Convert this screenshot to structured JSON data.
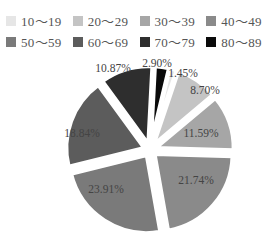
{
  "chart_data": {
    "type": "pie",
    "title": "",
    "legend_position": "top",
    "categories": [
      "10～19",
      "20～29",
      "30～39",
      "40～49",
      "50～59",
      "60～69",
      "70～79",
      "80～89"
    ],
    "values": [
      1.45,
      8.7,
      11.59,
      21.74,
      23.91,
      18.84,
      10.87,
      2.9
    ],
    "labels": [
      "1.45%",
      "8.70%",
      "11.59%",
      "21.74%",
      "23.91%",
      "18.84%",
      "10.87%",
      "2.90%"
    ],
    "colors": [
      "#e6e6e6",
      "#c4c4c4",
      "#a6a6a6",
      "#8a8a8a",
      "#7a7a7a",
      "#5c5c5c",
      "#2e2e2e",
      "#0a0a0a"
    ],
    "exploded": true,
    "slice_order_clockwise_from_top": [
      "80～89",
      "10～19",
      "20～29",
      "30～39",
      "40～49",
      "50～59",
      "60～69",
      "70～79"
    ]
  },
  "legend": {
    "items": [
      {
        "label": "10～19",
        "color": "#e6e6e6"
      },
      {
        "label": "20～29",
        "color": "#c4c4c4"
      },
      {
        "label": "30～39",
        "color": "#a6a6a6"
      },
      {
        "label": "40～49",
        "color": "#8a8a8a"
      },
      {
        "label": "50～59",
        "color": "#7a7a7a"
      },
      {
        "label": "60～69",
        "color": "#5c5c5c"
      },
      {
        "label": "70～79",
        "color": "#2e2e2e"
      },
      {
        "label": "80～89",
        "color": "#0a0a0a"
      }
    ]
  }
}
